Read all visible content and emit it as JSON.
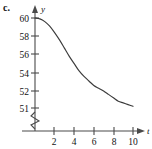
{
  "figure": {
    "part_label": "c.",
    "axis_x_name": "t",
    "axis_y_name": "y"
  },
  "chart_data": {
    "type": "line",
    "title": "",
    "subtitle": "",
    "xlabel": "t",
    "ylabel": "y",
    "xlim": [
      0,
      11
    ],
    "ylim": [
      51,
      60
    ],
    "grid": false,
    "legend": null,
    "y_axis_broken": true,
    "y_break_note": "zigzag break between 0 and 51",
    "xticks": [
      2,
      4,
      6,
      8,
      10
    ],
    "xtick_labels": [
      "2",
      "4",
      "6",
      "8",
      "10"
    ],
    "yticks": [
      51,
      52,
      54,
      56,
      58,
      60
    ],
    "ytick_labels": [
      "51",
      "52",
      "54",
      "56",
      "58",
      "60"
    ],
    "series": [
      {
        "name": "y(t)",
        "x": [
          0,
          0.5,
          1,
          1.5,
          2,
          2.5,
          3,
          3.5,
          4,
          4.5,
          5,
          5.5,
          6,
          6.5,
          7,
          7.5,
          8,
          8.5,
          9,
          9.5,
          10
        ],
        "values": [
          60.0,
          59.9,
          59.6,
          59.1,
          58.4,
          57.6,
          56.7,
          55.8,
          55.0,
          54.2,
          53.6,
          53.1,
          52.6,
          52.3,
          52.0,
          51.8,
          51.6,
          51.4,
          51.3,
          51.2,
          51.1
        ]
      }
    ],
    "annotations": [
      {
        "text": "c.",
        "position": "top-left"
      }
    ],
    "curve_description": "Decreasing S-shaped (logistic-like) decay from y=60 at t=0, flattening toward horizontal asymptote y=51 near t=10",
    "colors": {
      "curve": "#3b3b3b",
      "axis": "#4a4a4a",
      "text": "#111111",
      "background": "#ffffff"
    }
  }
}
